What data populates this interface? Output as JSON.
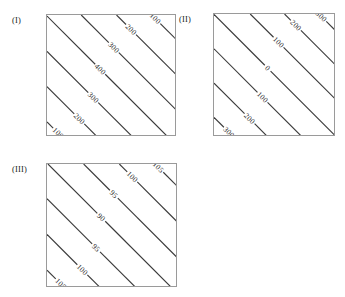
{
  "figure": {
    "background_color": "#ffffff",
    "line_color": "#3a3a3a",
    "frame_color": "#9a9a9a",
    "label_color": "#1f1f1f"
  },
  "panels": [
    {
      "tag": "(I)",
      "frame": {
        "x": 46,
        "y": 14,
        "w": 130,
        "h": 122
      }
    },
    {
      "tag": "(II)",
      "frame": {
        "x": 213,
        "y": 13,
        "w": 122,
        "h": 123
      }
    },
    {
      "tag": "(III)",
      "frame": {
        "x": 46,
        "y": 163,
        "w": 131,
        "h": 124
      }
    }
  ],
  "chart_data": [
    {
      "type": "line",
      "title": "(I)",
      "subtitle": "",
      "xlabel": "",
      "ylabel": "",
      "grid": false,
      "legend": "none",
      "plot_style": "contour",
      "contour_orientation": "diagonal-45-up",
      "pattern": "ridge",
      "contour_levels": [
        100,
        200,
        300,
        400,
        300,
        200,
        100
      ],
      "tick_labels_x": [],
      "tick_labels_y": [],
      "annotations": [
        "100",
        "200",
        "300",
        "400",
        "300",
        "200",
        "100"
      ],
      "contours": [
        {
          "label": "100",
          "offset": 0.1,
          "label_pos": 0.14
        },
        {
          "label": "200",
          "offset": 0.24,
          "label_pos": 0.24
        },
        {
          "label": "300",
          "offset": 0.38,
          "label_pos": 0.34
        },
        {
          "label": "400",
          "offset": 0.52,
          "label_pos": 0.44
        },
        {
          "label": "300",
          "offset": 0.66,
          "label_pos": 0.54
        },
        {
          "label": "200",
          "offset": 0.8,
          "label_pos": 0.64
        },
        {
          "label": "100",
          "offset": 0.94,
          "label_pos": 0.74
        }
      ]
    },
    {
      "type": "line",
      "title": "(II)",
      "subtitle": "",
      "xlabel": "",
      "ylabel": "",
      "grid": false,
      "legend": "none",
      "plot_style": "contour",
      "contour_orientation": "diagonal-45-up",
      "pattern": "monotonic-gradient",
      "contour_levels": [
        300,
        200,
        100,
        0,
        100,
        200,
        300
      ],
      "tick_labels_x": [],
      "tick_labels_y": [],
      "annotations": [
        "300",
        "200",
        "100",
        "0",
        "100",
        "200",
        "300"
      ],
      "contours": [
        {
          "label": "300",
          "offset": 0.07,
          "label_pos": 0.12
        },
        {
          "label": "200",
          "offset": 0.21,
          "label_pos": 0.22
        },
        {
          "label": "100",
          "offset": 0.35,
          "label_pos": 0.33
        },
        {
          "label": "0",
          "offset": 0.5,
          "label_pos": 0.44
        },
        {
          "label": "100",
          "offset": 0.64,
          "label_pos": 0.55
        },
        {
          "label": "200",
          "offset": 0.78,
          "label_pos": 0.66
        },
        {
          "label": "300",
          "offset": 0.92,
          "label_pos": 0.76
        }
      ]
    },
    {
      "type": "line",
      "title": "(III)",
      "subtitle": "",
      "xlabel": "",
      "ylabel": "",
      "grid": false,
      "legend": "none",
      "plot_style": "contour",
      "contour_orientation": "diagonal-45-up",
      "pattern": "valley",
      "contour_levels": [
        105,
        100,
        95,
        90,
        95,
        100,
        105
      ],
      "tick_labels_x": [],
      "tick_labels_y": [],
      "annotations": [
        "105",
        "100",
        "95",
        "90",
        "95",
        "100",
        "105"
      ],
      "contours": [
        {
          "label": "105",
          "offset": 0.09,
          "label_pos": 0.12
        },
        {
          "label": "100",
          "offset": 0.23,
          "label_pos": 0.22
        },
        {
          "label": "95",
          "offset": 0.37,
          "label_pos": 0.32
        },
        {
          "label": "90",
          "offset": 0.51,
          "label_pos": 0.43
        },
        {
          "label": "95",
          "offset": 0.65,
          "label_pos": 0.55
        },
        {
          "label": "100",
          "offset": 0.79,
          "label_pos": 0.66
        },
        {
          "label": "105",
          "offset": 0.93,
          "label_pos": 0.77
        }
      ]
    }
  ]
}
